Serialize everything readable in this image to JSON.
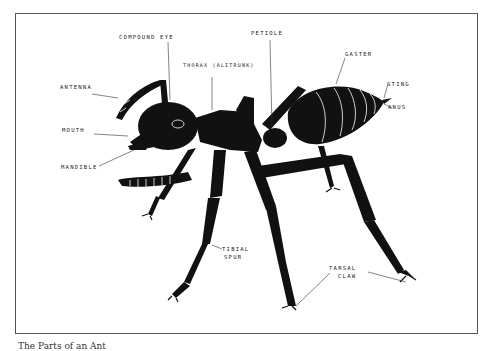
{
  "diagram": {
    "labels": {
      "compound_eye": "Compound Eye",
      "thorax": "Thorax (Alitrunk)",
      "petiole": "Petiole",
      "gaster": "Gaster",
      "sting": "Sting",
      "anus": "Anus",
      "antenna": "Antenna",
      "mouth": "Mouth",
      "mandible": "Mandible",
      "tibial_spur_1": "Tibial",
      "tibial_spur_2": "Spur",
      "tarsal_claw_1": "Tarsal",
      "tarsal_claw_2": "Claw"
    },
    "caption": "The Parts of an Ant"
  },
  "colors": {
    "ink": "#111111",
    "frame": "#555555",
    "background": "#ffffff"
  }
}
